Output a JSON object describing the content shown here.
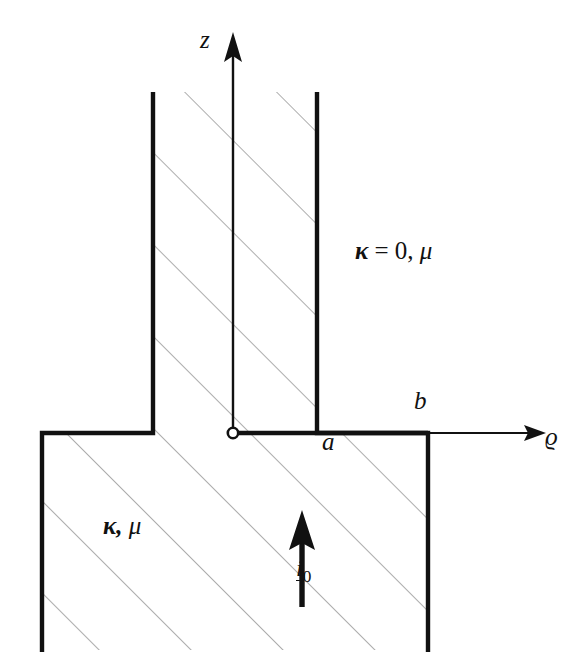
{
  "figure": {
    "background_color": "#ffffff",
    "stroke_color": "#111111",
    "hatch_color": "#808080",
    "width": 586,
    "height": 668
  },
  "axes": {
    "vertical": {
      "label": "z",
      "name": "z-axis",
      "x": 233,
      "y_top": 35,
      "y_bottom": 433,
      "arrow": "up"
    },
    "horizontal": {
      "label": "ϱ",
      "name": "rho-axis",
      "y": 433,
      "x_left": 233,
      "x_right": 545,
      "arrow": "right"
    },
    "origin": {
      "name": "origin-marker",
      "x": 233,
      "y": 433,
      "marker": "open-circle"
    }
  },
  "dimension_labels": [
    {
      "label": "a",
      "name": "radius-a-label",
      "x": 322,
      "y": 429
    },
    {
      "label": "b",
      "name": "radius-b-label",
      "x": 414,
      "y": 388
    }
  ],
  "regions": [
    {
      "name": "non-conducting-region",
      "label_kappa": "κ",
      "label_equals": "=",
      "label_value": "0,",
      "label_mu": "μ",
      "full_label": "κ = 0, μ",
      "x": 355,
      "y": 238
    },
    {
      "name": "conducting-region",
      "label_kappa": "κ,",
      "label_mu": "μ",
      "full_label": "κ, μ",
      "x": 103,
      "y": 513
    }
  ],
  "current": {
    "name": "current-arrow",
    "symbol": "i",
    "subscript": "0",
    "full_label": "i₀",
    "arrow_x": 302,
    "arrow_y_tail": 605,
    "arrow_y_head": 513,
    "direction": "up"
  },
  "geometry": {
    "hatch_angle_deg": 45,
    "hatch_spacing": 65,
    "outline_points": [
      [
        42,
        650
      ],
      [
        42,
        433
      ],
      [
        153,
        433
      ],
      [
        153,
        92
      ],
      [
        317,
        92
      ],
      [
        317,
        433
      ],
      [
        428,
        433
      ],
      [
        428,
        650
      ]
    ],
    "walls": {
      "left_outer_x": 42,
      "left_inner_x": 153,
      "right_inner_x": 317,
      "right_outer_x": 428,
      "slot_top_y": 92,
      "base_top_y": 433,
      "base_bottom_y": 650
    }
  }
}
